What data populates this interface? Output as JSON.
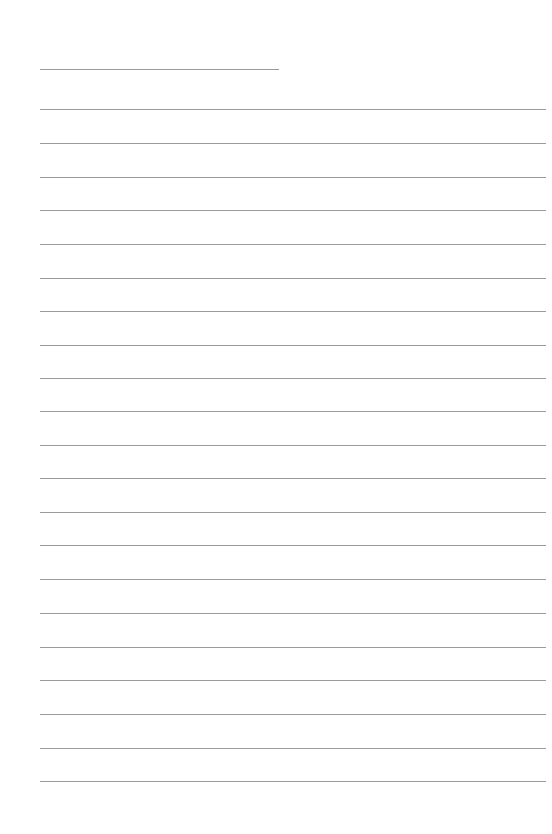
{
  "page": {
    "type": "lined-paper",
    "line_color": "#9a9a9a",
    "background": "#ffffff"
  },
  "lines": [
    {
      "y": 69,
      "x1": 40,
      "x2": 279
    },
    {
      "y": 109,
      "x1": 40,
      "x2": 546
    },
    {
      "y": 143,
      "x1": 40,
      "x2": 546
    },
    {
      "y": 177,
      "x1": 40,
      "x2": 546
    },
    {
      "y": 210,
      "x1": 40,
      "x2": 546
    },
    {
      "y": 244,
      "x1": 40,
      "x2": 546
    },
    {
      "y": 278,
      "x1": 40,
      "x2": 546
    },
    {
      "y": 311,
      "x1": 40,
      "x2": 546
    },
    {
      "y": 345,
      "x1": 40,
      "x2": 546
    },
    {
      "y": 378,
      "x1": 40,
      "x2": 546
    },
    {
      "y": 411,
      "x1": 40,
      "x2": 546
    },
    {
      "y": 445,
      "x1": 40,
      "x2": 546
    },
    {
      "y": 478,
      "x1": 40,
      "x2": 546
    },
    {
      "y": 512,
      "x1": 40,
      "x2": 546
    },
    {
      "y": 545,
      "x1": 40,
      "x2": 546
    },
    {
      "y": 579,
      "x1": 40,
      "x2": 546
    },
    {
      "y": 613,
      "x1": 40,
      "x2": 546
    },
    {
      "y": 647,
      "x1": 40,
      "x2": 546
    },
    {
      "y": 680,
      "x1": 40,
      "x2": 546
    },
    {
      "y": 714,
      "x1": 40,
      "x2": 546
    },
    {
      "y": 748,
      "x1": 40,
      "x2": 546
    },
    {
      "y": 781,
      "x1": 40,
      "x2": 546
    }
  ]
}
